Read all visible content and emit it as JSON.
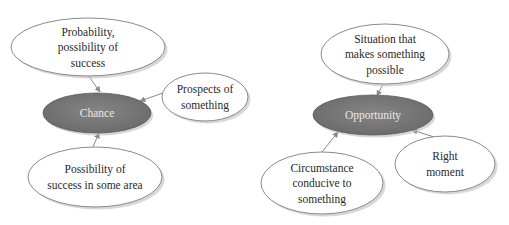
{
  "colors": {
    "center_fill": "#767676",
    "center_text": "#e8e8e8",
    "node_fill": "#ffffff",
    "node_stroke": "#8a8a8a",
    "node_shadow": "#c8c8c8",
    "connector": "#8a8a8a",
    "text": "#2a2a2a"
  },
  "clusters": [
    {
      "name": "chance",
      "center": {
        "label": "Chance",
        "cx": 97,
        "cy": 113,
        "rx": 54,
        "ry": 20
      },
      "satellites": [
        {
          "lines": [
            "Probability,",
            "possibility of",
            "success"
          ],
          "cx": 88,
          "cy": 47,
          "rx": 77,
          "ry": 29,
          "arrow": {
            "x1": 88,
            "y1": 75,
            "x2": 100,
            "y2": 92
          }
        },
        {
          "lines": [
            "Prospects of",
            "something"
          ],
          "cx": 205,
          "cy": 97,
          "rx": 43,
          "ry": 24,
          "arrow": {
            "x1": 163,
            "y1": 93,
            "x2": 140,
            "y2": 101
          }
        },
        {
          "lines": [
            "Possibility of",
            "success in some area"
          ],
          "cx": 95,
          "cy": 177,
          "rx": 67,
          "ry": 30,
          "arrow": {
            "x1": 93,
            "y1": 147,
            "x2": 99,
            "y2": 133
          }
        }
      ]
    },
    {
      "name": "opportunity",
      "center": {
        "label": "Opportunity",
        "cx": 373,
        "cy": 115,
        "rx": 60,
        "ry": 20
      },
      "satellites": [
        {
          "lines": [
            "Situation that",
            "makes something",
            "possible"
          ],
          "cx": 385,
          "cy": 54,
          "rx": 64,
          "ry": 30,
          "arrow": {
            "x1": 383,
            "y1": 84,
            "x2": 377,
            "y2": 96
          }
        },
        {
          "lines": [
            "Right",
            "moment"
          ],
          "cx": 445,
          "cy": 164,
          "rx": 50,
          "ry": 28,
          "arrow": {
            "x1": 434,
            "y1": 137,
            "x2": 412,
            "y2": 130
          }
        },
        {
          "lines": [
            "Circumstance",
            "conducive to",
            "something"
          ],
          "cx": 322,
          "cy": 183,
          "rx": 61,
          "ry": 31,
          "arrow": {
            "x1": 322,
            "y1": 152,
            "x2": 338,
            "y2": 132
          }
        }
      ]
    }
  ]
}
